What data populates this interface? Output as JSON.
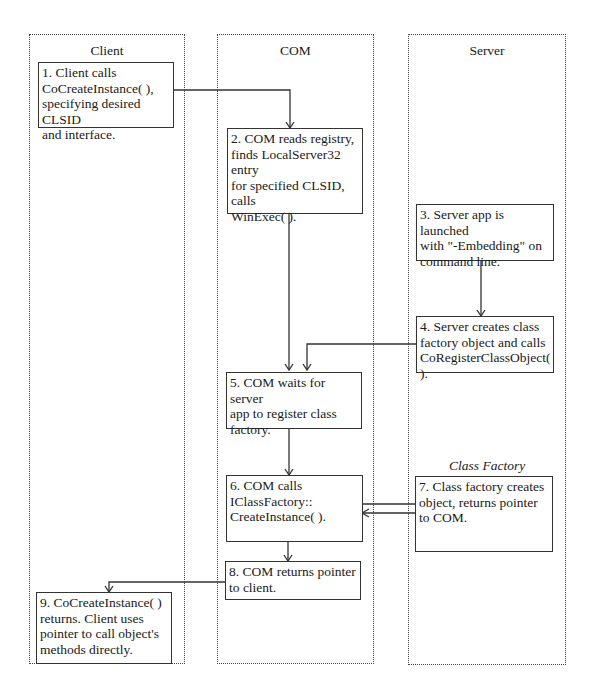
{
  "lanes": {
    "client": "Client",
    "com": "COM",
    "server": "Server"
  },
  "caption": {
    "class_factory": "Class Factory"
  },
  "steps": [
    {
      "id": 1,
      "lane": "Client",
      "text": "1.  Client calls\nCoCreateInstance( ),\nspecifying desired CLSID\nand interface."
    },
    {
      "id": 2,
      "lane": "COM",
      "text": "2.  COM reads registry,\nfinds LocalServer32 entry\nfor specified CLSID, calls\nWinExec( )."
    },
    {
      "id": 3,
      "lane": "Server",
      "text": "3.  Server app is launched\nwith \"-Embedding\" on\ncommand line."
    },
    {
      "id": 4,
      "lane": "Server",
      "text": "4.  Server creates class\nfactory object and calls\nCoRegisterClassObject( )."
    },
    {
      "id": 5,
      "lane": "COM",
      "text": "5. COM waits for server\napp to register class\nfactory."
    },
    {
      "id": 6,
      "lane": "COM",
      "text": "6.  COM calls\nIClassFactory::\n  CreateInstance( )."
    },
    {
      "id": 7,
      "lane": "Server",
      "text": "7.  Class factory creates\n   object, returns pointer\n   to COM."
    },
    {
      "id": 8,
      "lane": "COM",
      "text": "8.  COM returns pointer\nto client."
    },
    {
      "id": 9,
      "lane": "Client",
      "text": "9.  CoCreateInstance( )\nreturns. Client uses\npointer to call object's\nmethods directly."
    }
  ],
  "colors": {
    "line": "#333333",
    "lane_border": "#444444",
    "background": "#ffffff"
  }
}
